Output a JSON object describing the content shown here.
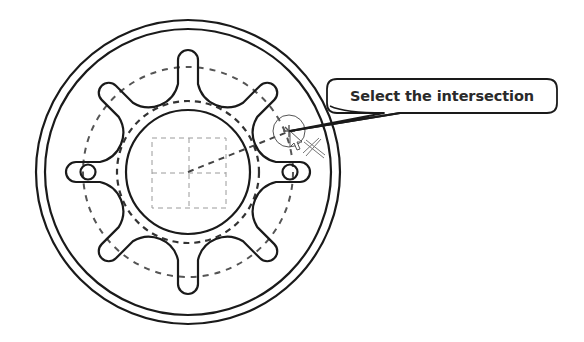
{
  "drawing": {
    "type": "cad-sketch",
    "part": "spoked-wheel-flange",
    "spoke_count": 8,
    "center": [
      188,
      172
    ],
    "colors": {
      "line": "#1a1a1a",
      "construction": "#555555",
      "sketch_grid": "#9a9a9a",
      "background": "#ffffff"
    }
  },
  "callout": {
    "text": "Select the intersection",
    "target_point": [
      290,
      131
    ]
  },
  "cursor": {
    "icon": "intersection-select-cursor"
  }
}
